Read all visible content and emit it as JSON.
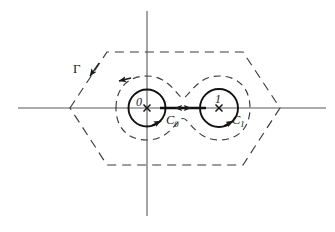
{
  "figure": {
    "kind": "complex-plane-contour-diagram",
    "background_color": "#ffffff",
    "line_color": "#1a1a1a",
    "axis_color": "#555555",
    "dashed_color": "#3a3a3a",
    "labels": {
      "outer_contour": "Γ",
      "origin_point": "0",
      "unit_point": "1",
      "left_circle": "C",
      "left_circle_sub": "0",
      "right_circle": "C",
      "right_circle_sub": "1"
    },
    "axes": {
      "real_axis_label": "",
      "imag_axis_label": "",
      "real_axis_y": 108,
      "real_axis_x_start": 18,
      "real_axis_x_end": 326,
      "imag_axis_x": 147,
      "imag_axis_y_start": 11,
      "imag_axis_y_end": 216
    },
    "markers": [
      {
        "name": "branch-point-0",
        "label": "0",
        "cx": 147,
        "cy": 108,
        "glyph": "x"
      },
      {
        "name": "branch-point-1",
        "label": "1",
        "cx": 219,
        "cy": 108,
        "glyph": "x"
      }
    ],
    "circles": [
      {
        "name": "C0",
        "cx": 147,
        "cy": 108,
        "r": 18.5,
        "orientation": "counterclockwise"
      },
      {
        "name": "C1",
        "cx": 219,
        "cy": 108,
        "r": 19.0,
        "orientation": "counterclockwise"
      }
    ],
    "branch_cut": {
      "name": "branch-cut",
      "x_start": 160,
      "x_end": 205,
      "y": 108,
      "arrows": "double"
    },
    "hexagon": {
      "name": "outer-dashed-hexagon",
      "vertices": [
        [
          70,
          108
        ],
        [
          107,
          52
        ],
        [
          243,
          52
        ],
        [
          280,
          108
        ],
        [
          243,
          165
        ],
        [
          107,
          165
        ]
      ],
      "dashed": true
    },
    "dumbbell": {
      "name": "inner-dashed-dumbbell",
      "dashed": true,
      "left_lobe_center": [
        147,
        108
      ],
      "left_lobe_radius": 31,
      "right_lobe_center": [
        219,
        108
      ],
      "right_lobe_radius": 31,
      "waist_x": 183,
      "waist_half_height": 13
    },
    "arrowheads": [
      {
        "name": "gamma-direction-arrow",
        "x": 92,
        "y": 73,
        "points": "down-left-along-edge"
      },
      {
        "name": "dumbbell-direction-arrow",
        "x": 118,
        "y": 80,
        "points": "left"
      },
      {
        "name": "c0-direction-arrow",
        "x": 160,
        "y": 122,
        "points": "up-right"
      },
      {
        "name": "c1-direction-arrow",
        "x": 232,
        "y": 122,
        "points": "up-right"
      },
      {
        "name": "cut-arrow-left",
        "x": 175,
        "y": 108,
        "points": "left"
      },
      {
        "name": "cut-arrow-right",
        "x": 190,
        "y": 108,
        "points": "right"
      }
    ]
  }
}
